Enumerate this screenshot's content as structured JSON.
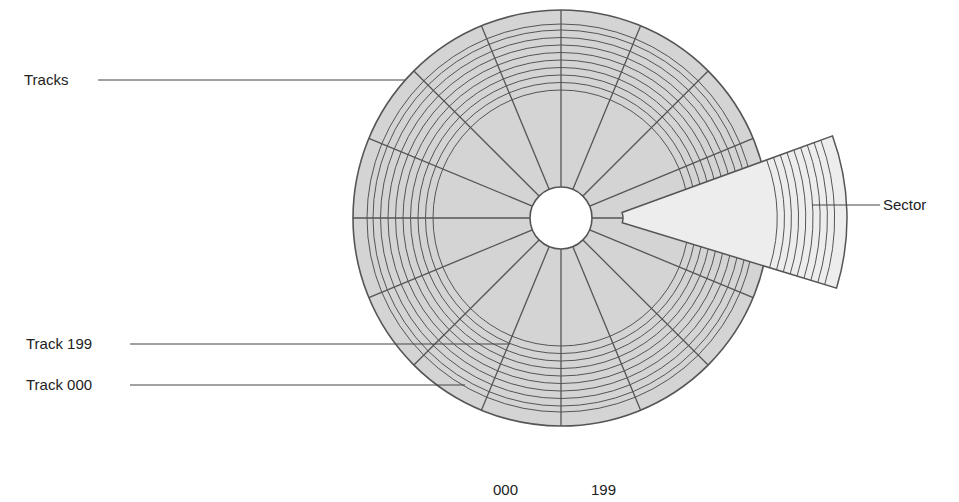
{
  "labels": {
    "tracks": "Tracks",
    "track_199": "Track 199",
    "track_000": "Track 000",
    "sector": "Sector",
    "bottom_000": "000",
    "bottom_199": "199"
  },
  "diagram": {
    "type": "disk-tracks-sectors",
    "sector_count": 16,
    "band_track_count": 9,
    "colors": {
      "disk_fill": "#d4d4d4",
      "sector_fill": "#ededed",
      "line": "#555555",
      "hole": "#ffffff"
    }
  }
}
